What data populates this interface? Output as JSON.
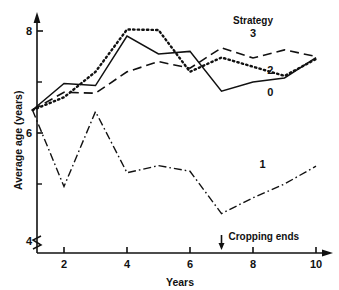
{
  "chart_data": {
    "type": "line",
    "title": "",
    "xlabel": "Years",
    "ylabel": "Average age (years)",
    "xlim": [
      1,
      10
    ],
    "ylim": [
      3.85,
      8.35
    ],
    "grid": false,
    "y_axis_break": true,
    "x_ticks": [
      2,
      4,
      6,
      8,
      10
    ],
    "x_tick_labels": [
      "2",
      "4",
      "6",
      "8",
      "10"
    ],
    "x_minor_ticks": [],
    "y_ticks": [
      4,
      6,
      8
    ],
    "y_tick_labels": [
      "4",
      "6",
      "8"
    ],
    "y_minor_ticks": [
      5,
      7
    ],
    "legend_position": "in-plot-right",
    "legend_title": "Strategy",
    "x": [
      1,
      2,
      3,
      4,
      5,
      6,
      7,
      8,
      9,
      10
    ],
    "series": [
      {
        "name": "0",
        "label": "0",
        "style": "solid",
        "values": [
          6.45,
          6.97,
          6.93,
          7.9,
          7.55,
          7.6,
          6.82,
          7.0,
          7.08,
          7.48
        ]
      },
      {
        "name": "1",
        "label": "1",
        "style": "dash-dot",
        "values": [
          6.45,
          4.95,
          6.42,
          5.22,
          5.36,
          5.25,
          4.42,
          4.73,
          5.0,
          5.35
        ]
      },
      {
        "name": "2",
        "label": "2",
        "style": "dotted",
        "values": [
          6.45,
          6.7,
          7.2,
          8.03,
          8.02,
          7.2,
          7.48,
          7.3,
          7.12,
          7.45
        ]
      },
      {
        "name": "3",
        "label": "3",
        "style": "dashed",
        "values": [
          6.45,
          6.8,
          6.78,
          7.2,
          7.4,
          7.27,
          7.67,
          7.47,
          7.63,
          7.5
        ]
      }
    ],
    "annotations": [
      {
        "text": "Cropping ends",
        "x": 7,
        "marker": "down-arrow"
      }
    ],
    "series_label_positions": [
      {
        "series": "0",
        "x": 8.55,
        "y": 6.78
      },
      {
        "series": "1",
        "x": 8.3,
        "y": 5.37
      },
      {
        "series": "2",
        "x": 8.55,
        "y": 7.22
      },
      {
        "series": "3",
        "x": 8.0,
        "y": 7.95
      }
    ]
  },
  "axes": {
    "x_title": "Years",
    "y_title": "Average age (years)",
    "x_tick_labels": [
      "2",
      "4",
      "6",
      "8",
      "10"
    ],
    "y_tick_labels": [
      "4",
      "6",
      "8"
    ]
  },
  "legend": {
    "title": "Strategy",
    "entries": [
      "3",
      "2",
      "0",
      "1"
    ]
  },
  "annotation": {
    "cropping_ends": "Cropping ends"
  },
  "colors": {
    "line": "#111111",
    "axis": "#111111",
    "background": "#ffffff"
  }
}
